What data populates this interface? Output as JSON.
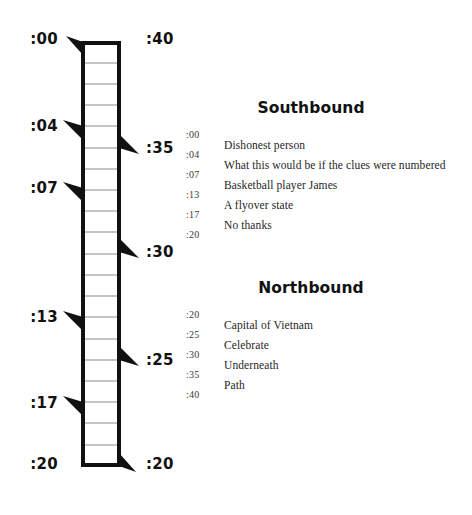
{
  "diagram": {
    "name": "subway-line-ladder",
    "left_stops": [
      {
        "time": ":00",
        "y": 40
      },
      {
        "time": ":04",
        "y": 128
      },
      {
        "time": ":07",
        "y": 190
      },
      {
        "time": ":13",
        "y": 320
      },
      {
        "time": ":17",
        "y": 408
      },
      {
        "time": ":20",
        "y": 468
      }
    ],
    "right_stops": [
      {
        "time": ":40",
        "y": 40
      },
      {
        "time": ":35",
        "y": 150
      },
      {
        "time": ":30",
        "y": 254
      },
      {
        "time": ":25",
        "y": 362
      },
      {
        "time": ":20",
        "y": 468
      }
    ],
    "rung_count": 20,
    "track_top": 42,
    "track_bottom": 466,
    "rail_left_x": 82,
    "rail_right_x": 120,
    "stroke_color": "#111111",
    "rung_color": "#8a8a8a"
  },
  "southbound": {
    "heading": "Southbound",
    "times": [
      ":00",
      ":04",
      ":07",
      ":13",
      ":17",
      ":20"
    ],
    "clues": [
      "Dishonest person",
      "What this would be if the clues were numbered",
      "Basketball player James",
      "A flyover state",
      "No thanks"
    ]
  },
  "northbound": {
    "heading": "Northbound",
    "times": [
      ":20",
      ":25",
      ":30",
      ":35",
      ":40"
    ],
    "clues": [
      "Capital of Vietnam",
      "Celebrate",
      "Underneath",
      "Path"
    ]
  }
}
